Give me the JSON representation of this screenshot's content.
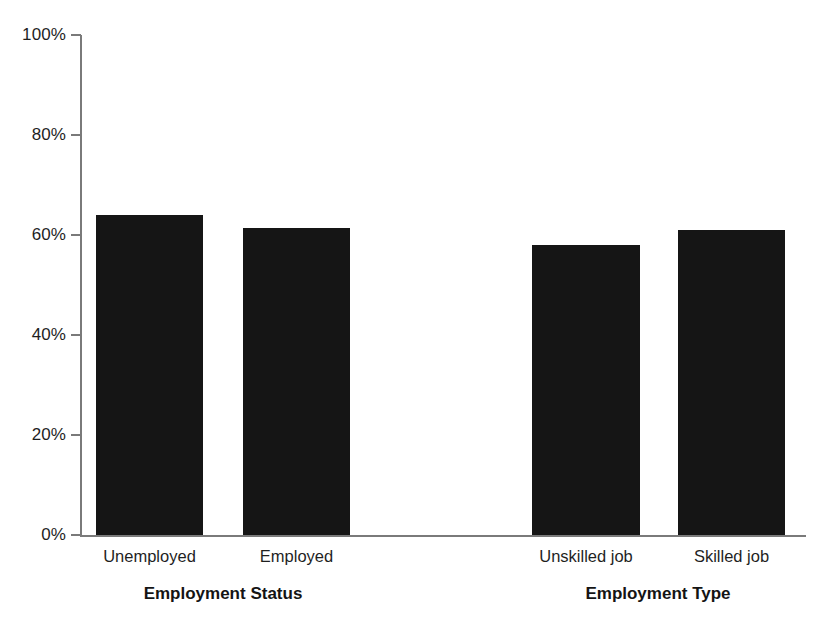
{
  "chart_data": {
    "type": "bar",
    "title": "",
    "subtitle": "",
    "xlabel": "",
    "ylabel": "",
    "ylim": [
      0,
      100
    ],
    "y_unit": "%",
    "grid": false,
    "legend": "none",
    "orientation": "vertical",
    "categories": [
      "Unemployed",
      "Employed",
      "Unskilled job",
      "Skilled job"
    ],
    "values": [
      64,
      61.5,
      58,
      61
    ],
    "series": [
      {
        "name": "Proportion",
        "values": [
          64,
          61.5,
          58,
          61
        ]
      }
    ],
    "groups": [
      {
        "title": "Employment Status",
        "categories": [
          "Unemployed",
          "Employed"
        ],
        "values": [
          64,
          61.5
        ]
      },
      {
        "title": "Employment Type",
        "categories": [
          "Unskilled job",
          "Skilled job"
        ],
        "values": [
          58,
          61
        ]
      }
    ],
    "yticks": [
      0,
      20,
      40,
      60,
      80,
      100
    ],
    "ytick_labels": [
      "0%",
      "20%",
      "40%",
      "60%",
      "80%",
      "100%"
    ],
    "bar_color": "#151515",
    "axis_color": "#7a7a7a",
    "background_color": "#ffffff"
  },
  "axis": {
    "y_labels": [
      "100%",
      "80%",
      "60%",
      "40%",
      "20%",
      "0%"
    ]
  },
  "bars": [
    {
      "label": "Unemployed",
      "value": 64,
      "left": 96,
      "width": 107
    },
    {
      "label": "Employed",
      "value": 61.5,
      "left": 243,
      "width": 107
    },
    {
      "label": "Unskilled job",
      "value": 58,
      "left": 532,
      "width": 108
    },
    {
      "label": "Skilled job",
      "value": 61,
      "left": 678,
      "width": 107
    }
  ],
  "groups": [
    {
      "title": "Employment Status",
      "center": 223
    },
    {
      "title": "Employment Type",
      "center": 658
    }
  ]
}
